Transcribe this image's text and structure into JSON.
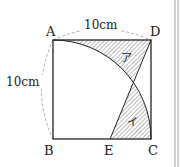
{
  "figure": {
    "points": {
      "A": "A",
      "B": "B",
      "C": "C",
      "D": "D",
      "E": "E"
    },
    "dimensions": {
      "top": "10cm",
      "left": "10cm"
    },
    "regions": {
      "upper": "ア",
      "lower": "イ"
    },
    "colors": {
      "line": "#222222",
      "hatch": "#555555",
      "dashed": "#999999"
    }
  }
}
